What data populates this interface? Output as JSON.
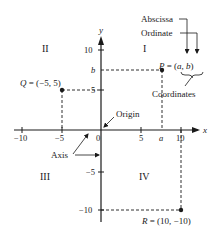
{
  "diagram": {
    "type": "cartesian-coordinate-plane",
    "axes": {
      "x_label": "x",
      "y_label": "y",
      "x_ticks": [
        "−10",
        "−5",
        "0",
        "5",
        "10"
      ],
      "y_ticks": [
        "10",
        "5",
        "−5",
        "−10"
      ],
      "a_label": "a",
      "b_label": "b"
    },
    "quadrants": {
      "I": "I",
      "II": "II",
      "III": "III",
      "IV": "IV"
    },
    "points": {
      "P": {
        "label": "P = (a, b)",
        "name": "P",
        "coords": "(a, b)"
      },
      "Q": {
        "label": "Q = (−5, 5)",
        "x": -5,
        "y": 5
      },
      "R": {
        "label": "R = (10, −10)",
        "x": 10,
        "y": -10
      }
    },
    "annotations": {
      "abscissa": "Abscissa",
      "ordinate": "Ordinate",
      "coordinates": "Coordinates",
      "origin": "Origin",
      "axis": "Axis"
    },
    "colors": {
      "ink": "#1a1a1a",
      "background": "#ffffff"
    }
  }
}
